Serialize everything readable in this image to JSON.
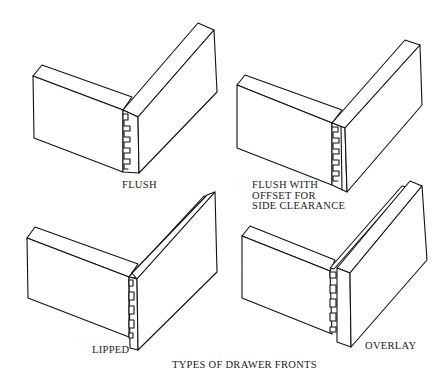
{
  "figure": {
    "caption": "TYPES OF DRAWER FRONTS",
    "line_color": "#111111",
    "background": "#ffffff"
  },
  "panels": [
    {
      "id": "flush",
      "label_lines": [
        "FLUSH"
      ]
    },
    {
      "id": "flush-offset",
      "label_lines": [
        "FLUSH WITH",
        "OFFSET FOR",
        "SIDE CLEARANCE"
      ]
    },
    {
      "id": "lipped",
      "label_lines": [
        "LIPPED"
      ]
    },
    {
      "id": "overlay",
      "label_lines": [
        "OVERLAY"
      ]
    }
  ]
}
